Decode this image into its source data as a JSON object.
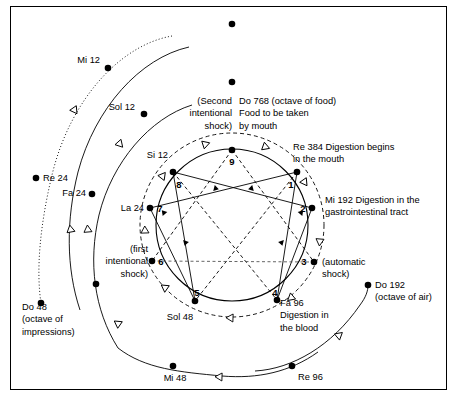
{
  "figure": {
    "frame_color": "#000000",
    "background": "#ffffff",
    "ink_color": "#000000"
  },
  "inner_points": [
    {
      "id": "p9",
      "number": "9",
      "x": 232,
      "y": 150,
      "num_x": 232,
      "num_y": 165,
      "num_anchor": "middle"
    },
    {
      "id": "p1",
      "number": "1",
      "x": 297,
      "y": 172,
      "num_x": 291,
      "num_y": 188,
      "num_anchor": "middle"
    },
    {
      "id": "p2",
      "number": "2",
      "x": 312,
      "y": 208,
      "num_x": 303,
      "num_y": 212,
      "num_anchor": "middle"
    },
    {
      "id": "p3",
      "number": "3",
      "x": 314,
      "y": 262,
      "num_x": 304,
      "num_y": 265,
      "num_anchor": "middle"
    },
    {
      "id": "p4",
      "number": "4",
      "x": 277,
      "y": 300,
      "num_x": 275,
      "num_y": 296,
      "num_anchor": "middle"
    },
    {
      "id": "p5",
      "number": "5",
      "x": 195,
      "y": 301,
      "num_x": 197,
      "num_y": 296,
      "num_anchor": "middle"
    },
    {
      "id": "p6",
      "number": "6",
      "x": 152,
      "y": 261,
      "num_x": 161,
      "num_y": 265,
      "num_anchor": "middle"
    },
    {
      "id": "p7",
      "number": "7",
      "x": 150,
      "y": 208,
      "num_x": 160,
      "num_y": 212,
      "num_anchor": "middle"
    },
    {
      "id": "p8",
      "number": "8",
      "x": 173,
      "y": 172,
      "num_x": 179,
      "num_y": 188,
      "num_anchor": "middle"
    }
  ],
  "inner_labels": [
    {
      "id": "label-do768",
      "anchor": "start",
      "x": 239,
      "y": 104,
      "lines": [
        "Do 768 (octave of food)",
        "Food to be taken",
        "by mouth"
      ]
    },
    {
      "id": "label-second-shock",
      "anchor": "end",
      "x": 232,
      "y": 104,
      "lines": [
        "(Second",
        "intentional",
        "shock)"
      ]
    },
    {
      "id": "label-re384",
      "anchor": "start",
      "x": 293,
      "y": 150,
      "lines": [
        "Re 384 Digestion begins",
        "in the mouth"
      ]
    },
    {
      "id": "label-mi192",
      "anchor": "start",
      "x": 325,
      "y": 203,
      "lines": [
        "Mi 192 Digestion in the",
        "gastrointestinal tract"
      ]
    },
    {
      "id": "label-automatic-shock",
      "anchor": "start",
      "x": 322,
      "y": 265,
      "lines": [
        "(automatic",
        "shock)"
      ]
    },
    {
      "id": "label-fa96",
      "anchor": "start",
      "x": 280,
      "y": 306,
      "lines": [
        "Fa 96",
        "Digestion in",
        "the blood"
      ]
    },
    {
      "id": "label-sol48",
      "anchor": "middle",
      "x": 180,
      "y": 320,
      "lines": [
        "Sol 48"
      ]
    },
    {
      "id": "label-first-shock",
      "anchor": "end",
      "x": 148,
      "y": 252,
      "lines": [
        "(first",
        "intentional",
        "shock)"
      ]
    },
    {
      "id": "label-la24",
      "anchor": "end",
      "x": 144,
      "y": 211,
      "lines": [
        "La 24"
      ]
    },
    {
      "id": "label-si12",
      "anchor": "end",
      "x": 168,
      "y": 158,
      "lines": [
        "Si 12"
      ]
    }
  ],
  "outer_labels": [
    {
      "id": "label-mi12",
      "anchor": "end",
      "x": 100,
      "y": 63,
      "lines": [
        "Mi 12"
      ]
    },
    {
      "id": "label-sol12",
      "anchor": "end",
      "x": 135,
      "y": 110,
      "lines": [
        "Sol 12"
      ]
    },
    {
      "id": "label-re24",
      "anchor": "start",
      "x": 43,
      "y": 181,
      "lines": [
        "Re 24"
      ]
    },
    {
      "id": "label-fa24",
      "anchor": "end",
      "x": 86,
      "y": 196,
      "lines": [
        "Fa 24"
      ]
    },
    {
      "id": "label-do48",
      "anchor": "start",
      "x": 22,
      "y": 310,
      "lines": [
        "Do 48",
        "(octave of",
        "impressions)"
      ]
    },
    {
      "id": "label-mi48",
      "anchor": "middle",
      "x": 175,
      "y": 381,
      "lines": [
        "Mi 48"
      ]
    },
    {
      "id": "label-re96",
      "anchor": "start",
      "x": 298,
      "y": 380,
      "lines": [
        "Re 96"
      ]
    },
    {
      "id": "label-do192",
      "anchor": "start",
      "x": 375,
      "y": 288,
      "lines": [
        "Do 192",
        "(octave of air)"
      ]
    }
  ],
  "outer_points": [
    {
      "id": "dot-top-outer",
      "x": 232,
      "y": 24
    },
    {
      "id": "dot-top-inner",
      "x": 232,
      "y": 82
    },
    {
      "id": "dot-mi12",
      "x": 108,
      "y": 68
    },
    {
      "id": "dot-sol12",
      "x": 144,
      "y": 114
    },
    {
      "id": "dot-re24",
      "x": 36,
      "y": 178
    },
    {
      "id": "dot-fa24",
      "x": 92,
      "y": 194
    },
    {
      "id": "dot-ring2-left",
      "x": 96,
      "y": 284
    },
    {
      "id": "dot-do48",
      "x": 41,
      "y": 303
    },
    {
      "id": "dot-mi48",
      "x": 173,
      "y": 366
    },
    {
      "id": "dot-re96",
      "x": 292,
      "y": 366
    },
    {
      "id": "dot-do192",
      "x": 368,
      "y": 285
    }
  ],
  "ring_arrows": [
    {
      "id": "arrow-ring1-upper-left",
      "x": 71,
      "y": 232,
      "rot": -100
    },
    {
      "id": "arrow-ring1-mid-left",
      "x": 73,
      "y": 108,
      "rot": 55
    },
    {
      "id": "arrow-ring2-left",
      "x": 88,
      "y": 232,
      "rot": -95
    },
    {
      "id": "arrow-ring2-lower-left",
      "x": 120,
      "y": 325,
      "rot": -145
    },
    {
      "id": "arrow-ring2-upper",
      "x": 118,
      "y": 142,
      "rot": 48
    },
    {
      "id": "arrow-ring2-bottom",
      "x": 222,
      "y": 377,
      "rot": 182
    },
    {
      "id": "arrow-ring3-right-low",
      "x": 337,
      "y": 337,
      "rot": -40
    },
    {
      "id": "arrow-inner-left-mid",
      "x": 145,
      "y": 233,
      "rot": -92
    },
    {
      "id": "arrow-inner-upper-left",
      "x": 161,
      "y": 178,
      "rot": -52
    },
    {
      "id": "arrow-inner-top-left",
      "x": 203,
      "y": 145,
      "rot": -18
    },
    {
      "id": "arrow-inner-top-right",
      "x": 263,
      "y": 146,
      "rot": 20
    },
    {
      "id": "arrow-inner-upper-right",
      "x": 303,
      "y": 180,
      "rot": 55
    },
    {
      "id": "arrow-inner-right-mid",
      "x": 320,
      "y": 239,
      "rot": 95
    },
    {
      "id": "arrow-inner-lower-right",
      "x": 293,
      "y": 296,
      "rot": 140
    },
    {
      "id": "arrow-inner-bottom",
      "x": 233,
      "y": 318,
      "rot": 182
    },
    {
      "id": "arrow-inner-lower-left",
      "x": 167,
      "y": 289,
      "rot": -145
    }
  ],
  "chart_data": {
    "type": "diagram",
    "diagram_kind": "enneagram-food-diagram",
    "inner_enneagram": {
      "circle": {
        "cx": 232,
        "cy": 225,
        "r": 76
      },
      "triangle_points": [
        "9",
        "3",
        "6"
      ],
      "hexad_sequence": [
        "1",
        "4",
        "2",
        "8",
        "5",
        "7",
        "1"
      ],
      "note": "Inner octave lines drawn as solid polygon plus dashed descent lines from 9"
    },
    "octaves": [
      {
        "name": "Food octave",
        "notes": [
          {
            "note": "Do 768",
            "description": "octave of food; Food to be taken by mouth",
            "position": "9"
          },
          {
            "note": "Re 384",
            "description": "Digestion begins in the mouth",
            "position": "1"
          },
          {
            "note": "Mi 192",
            "description": "Digestion in the gastrointestinal tract",
            "position": "2"
          },
          {
            "note": "Fa 96",
            "description": "Digestion in the blood",
            "position": "4"
          },
          {
            "note": "Sol 48",
            "description": "",
            "position": "5"
          },
          {
            "note": "La 24",
            "description": "",
            "position": "7"
          },
          {
            "note": "Si 12",
            "description": "",
            "position": "8"
          }
        ]
      },
      {
        "name": "Air octave",
        "notes": [
          {
            "note": "Do 192",
            "description": "octave of air",
            "position": "outer"
          },
          {
            "note": "Re 96",
            "description": "",
            "position": "outer"
          },
          {
            "note": "Mi 48",
            "description": "",
            "position": "outer"
          },
          {
            "note": "Fa 24",
            "description": "",
            "position": "outer"
          },
          {
            "note": "Sol 12",
            "description": "",
            "position": "outer"
          }
        ]
      },
      {
        "name": "Impressions octave",
        "notes": [
          {
            "note": "Do 48",
            "description": "octave of impressions",
            "position": "outer"
          },
          {
            "note": "Re 24",
            "description": "",
            "position": "outer"
          },
          {
            "note": "Mi 12",
            "description": "",
            "position": "outer"
          }
        ]
      }
    ],
    "shocks": [
      {
        "name": "automatic shock",
        "at": "3"
      },
      {
        "name": "first intentional shock",
        "at": "6"
      },
      {
        "name": "Second intentional shock",
        "at": "top / 9"
      }
    ]
  }
}
